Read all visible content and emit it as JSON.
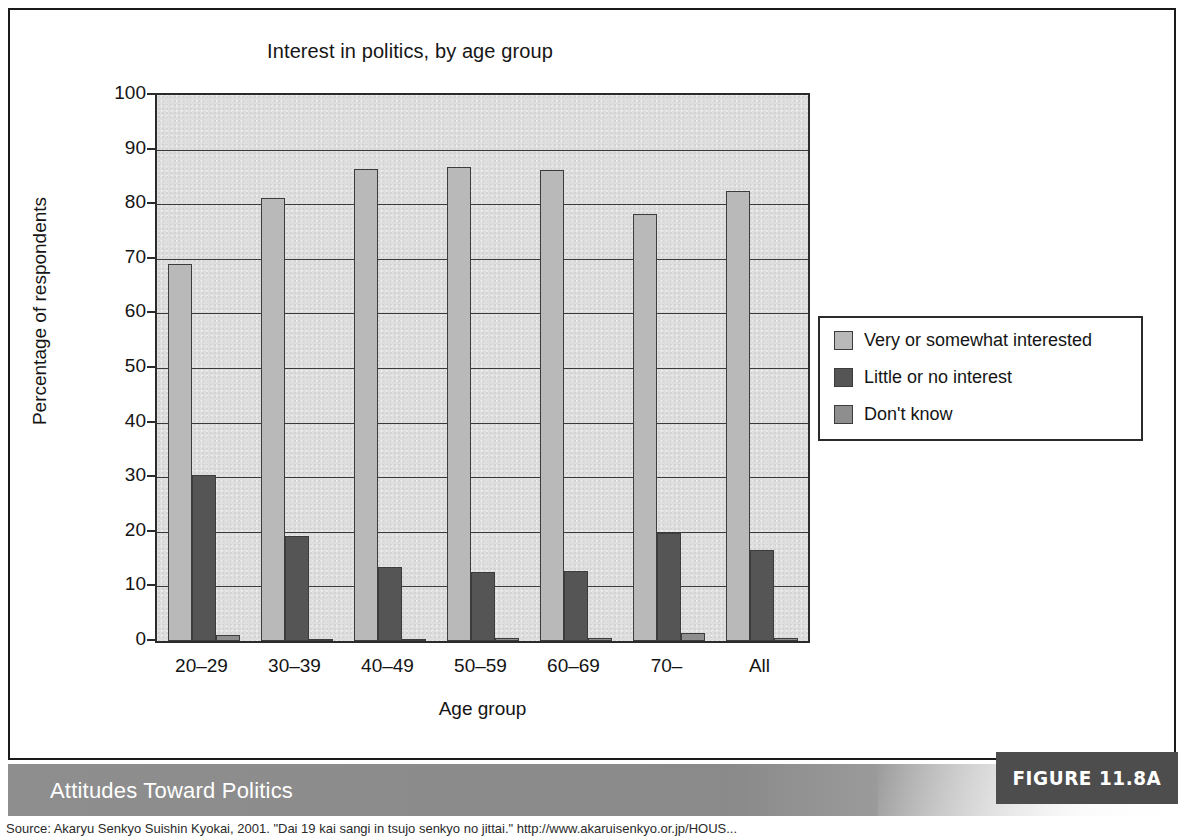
{
  "figure": {
    "banner_title": "Attitudes Toward Politics",
    "figure_tag": "FIGURE 11.8A",
    "source": "Source: Akaryu Senkyo Suishin Kyokai, 2001. \"Dai 19 kai sangi in tsujo senkyo no jittai.\" http://www.akaruisenkyo.or.jp/HOUS..."
  },
  "chart_data": {
    "type": "bar",
    "title": "Interest in politics, by age group",
    "xlabel": "Age group",
    "ylabel": "Percentage of respondents",
    "ylim": [
      0,
      100
    ],
    "yticks": [
      0,
      10,
      20,
      30,
      40,
      50,
      60,
      70,
      80,
      90,
      100
    ],
    "grid": true,
    "legend_position": "right",
    "categories": [
      "20–29",
      "30–39",
      "40–49",
      "50–59",
      "60–69",
      "70–",
      "All"
    ],
    "series": [
      {
        "name": "Very or somewhat interested",
        "color": "#b9b9b9",
        "values": [
          69.1,
          81.1,
          86.5,
          86.9,
          86.3,
          78.2,
          82.5
        ]
      },
      {
        "name": "Little or no interest",
        "color": "#555555",
        "values": [
          30.4,
          19.3,
          13.5,
          12.7,
          12.9,
          19.7,
          16.6
        ]
      },
      {
        "name": "Don't know",
        "color": "#8e8e8e",
        "values": [
          1.1,
          0.2,
          0.2,
          0.5,
          0.5,
          1.4,
          0.6
        ]
      }
    ]
  }
}
